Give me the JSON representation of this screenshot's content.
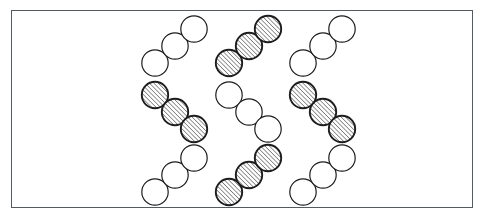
{
  "figure": {
    "canvas": {
      "width": 484,
      "height": 220,
      "background": "#ffffff"
    },
    "frame": {
      "name": "figure-border",
      "x": 11,
      "y": 10,
      "width": 462,
      "height": 198,
      "stroke": "#555a5e",
      "stroke_width": 1.4,
      "fill": "#ffffff"
    },
    "circle": {
      "radius": 13.2,
      "white_fill": "#ffffff",
      "white_stroke": "#1d1d1d",
      "white_stroke_width": 1.2,
      "hatched_fill": "hatch-diagonal",
      "hatched_stroke": "#1d1d1d",
      "hatched_stroke_width": 1.9,
      "hatch_color": "#3a3a3a",
      "hatch_spacing": 3.1,
      "hatch_angle_deg": 45,
      "hatch_direction": "bottom-left-to-top-right"
    },
    "grid": {
      "rows": 3,
      "columns": 3,
      "column_x": [
        148,
        222,
        296
      ],
      "row_y": [
        30,
        96,
        162
      ]
    },
    "clusters": [
      {
        "id": "cluster-r1c1",
        "row": 1,
        "column": 1,
        "fill": "white",
        "orientation": "ascending",
        "circles": [
          {
            "cx": 155,
            "cy": 63
          },
          {
            "cx": 175,
            "cy": 46
          },
          {
            "cx": 194,
            "cy": 29
          }
        ]
      },
      {
        "id": "cluster-r1c2",
        "row": 1,
        "column": 2,
        "fill": "hatched",
        "orientation": "ascending",
        "circles": [
          {
            "cx": 229,
            "cy": 63
          },
          {
            "cx": 249,
            "cy": 46
          },
          {
            "cx": 268,
            "cy": 29
          }
        ]
      },
      {
        "id": "cluster-r1c3",
        "row": 1,
        "column": 3,
        "fill": "white",
        "orientation": "ascending",
        "circles": [
          {
            "cx": 303,
            "cy": 63
          },
          {
            "cx": 323,
            "cy": 46
          },
          {
            "cx": 342,
            "cy": 29
          }
        ]
      },
      {
        "id": "cluster-r2c1",
        "row": 2,
        "column": 1,
        "fill": "hatched",
        "orientation": "descending",
        "circles": [
          {
            "cx": 155,
            "cy": 95
          },
          {
            "cx": 175,
            "cy": 112
          },
          {
            "cx": 194,
            "cy": 129
          }
        ]
      },
      {
        "id": "cluster-r2c2",
        "row": 2,
        "column": 2,
        "fill": "white",
        "orientation": "descending",
        "circles": [
          {
            "cx": 229,
            "cy": 95
          },
          {
            "cx": 249,
            "cy": 112
          },
          {
            "cx": 268,
            "cy": 129
          }
        ]
      },
      {
        "id": "cluster-r2c3",
        "row": 2,
        "column": 3,
        "fill": "hatched",
        "orientation": "descending",
        "circles": [
          {
            "cx": 303,
            "cy": 95
          },
          {
            "cx": 323,
            "cy": 112
          },
          {
            "cx": 342,
            "cy": 129
          }
        ]
      },
      {
        "id": "cluster-r3c1",
        "row": 3,
        "column": 1,
        "fill": "white",
        "orientation": "ascending",
        "circles": [
          {
            "cx": 155,
            "cy": 192
          },
          {
            "cx": 175,
            "cy": 175
          },
          {
            "cx": 194,
            "cy": 158
          }
        ]
      },
      {
        "id": "cluster-r3c2",
        "row": 3,
        "column": 2,
        "fill": "hatched",
        "orientation": "ascending",
        "circles": [
          {
            "cx": 229,
            "cy": 192
          },
          {
            "cx": 249,
            "cy": 175
          },
          {
            "cx": 268,
            "cy": 158
          }
        ]
      },
      {
        "id": "cluster-r3c3",
        "row": 3,
        "column": 3,
        "fill": "white",
        "orientation": "ascending",
        "circles": [
          {
            "cx": 303,
            "cy": 192
          },
          {
            "cx": 323,
            "cy": 175
          },
          {
            "cx": 342,
            "cy": 158
          }
        ]
      }
    ]
  }
}
